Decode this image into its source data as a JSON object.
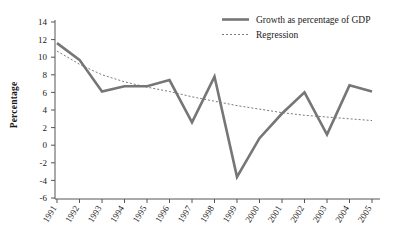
{
  "chart_data": {
    "type": "line",
    "title": "",
    "xlabel": "",
    "ylabel": "Percentage",
    "xlim": [
      1991,
      2005
    ],
    "ylim": [
      -6,
      14
    ],
    "ytick_step": 2,
    "grid": false,
    "legend_position": "top-right",
    "categories": [
      "1991",
      "1992",
      "1993",
      "1994",
      "1995",
      "1996",
      "1997",
      "1998",
      "1999",
      "2000",
      "2001",
      "2002",
      "2003",
      "2004",
      "2005"
    ],
    "x": [
      1991,
      1992,
      1993,
      1994,
      1995,
      1996,
      1997,
      1998,
      1999,
      2000,
      2001,
      2002,
      2003,
      2004,
      2005
    ],
    "yticks": [
      14,
      12,
      10,
      8,
      6,
      4,
      2,
      0,
      -2,
      -4,
      -6
    ],
    "ytick_labels": [
      "14",
      "12",
      "10",
      "8",
      "6",
      "4",
      "2",
      "0",
      "-2",
      "-4",
      "-6"
    ],
    "series": [
      {
        "name": "Growth as percentage of GDP",
        "style": "solid",
        "color": "#767676",
        "values": [
          11.6,
          9.7,
          6.1,
          6.7,
          6.7,
          7.4,
          2.6,
          7.8,
          -3.6,
          0.8,
          3.6,
          6.0,
          1.2,
          6.8,
          6.1
        ]
      },
      {
        "name": "Regression",
        "style": "dotted",
        "color": "#6b6b6b",
        "values": [
          10.7,
          9.2,
          8.0,
          7.2,
          6.6,
          6.1,
          5.5,
          5.0,
          4.5,
          4.1,
          3.7,
          3.4,
          3.2,
          3.0,
          2.8
        ]
      }
    ],
    "legend": [
      {
        "label": "Growth as percentage of GDP",
        "style": "solid",
        "color": "#767676"
      },
      {
        "label": "Regression",
        "style": "dotted",
        "color": "#6b6b6b"
      }
    ]
  }
}
